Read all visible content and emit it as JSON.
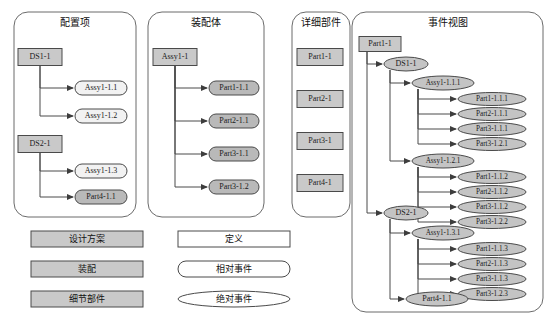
{
  "diagram": {
    "title": "",
    "colors": {
      "rect_fill": "#c9c9c9",
      "stadium_light": "#f2f2f2",
      "stadium_dark": "#b9b9b9",
      "ellipse_fill": "#c4c4c4",
      "panel_stroke": "#6b6b6b",
      "edge_stroke": "#4a4a4a",
      "white": "#ffffff"
    },
    "panels": [
      {
        "id": "p1",
        "title": "配置项",
        "x": 14,
        "y": 12,
        "w": 122,
        "h": 205
      },
      {
        "id": "p2",
        "title": "装配体",
        "x": 148,
        "y": 12,
        "w": 116,
        "h": 205
      },
      {
        "id": "p3",
        "title": "详细部件",
        "x": 292,
        "y": 12,
        "w": 58,
        "h": 205
      },
      {
        "id": "p4",
        "title": "事件视图",
        "x": 352,
        "y": 12,
        "w": 191,
        "h": 300
      }
    ],
    "panel1_nodes": [
      {
        "label": "DS1-1",
        "shape": "rect",
        "tone": "rect",
        "cx": 40,
        "cy": 57,
        "w": 44,
        "h": 17
      },
      {
        "label": "Assy1-1.1",
        "shape": "stadium",
        "tone": "light",
        "cx": 101,
        "cy": 88,
        "w": 52,
        "h": 14
      },
      {
        "label": "Assy1-1.2",
        "shape": "stadium",
        "tone": "light",
        "cx": 101,
        "cy": 116,
        "w": 52,
        "h": 14
      },
      {
        "label": "DS2-1",
        "shape": "rect",
        "tone": "rect",
        "cx": 40,
        "cy": 144,
        "w": 44,
        "h": 17
      },
      {
        "label": "Assy1-1.3",
        "shape": "stadium",
        "tone": "light",
        "cx": 101,
        "cy": 171,
        "w": 52,
        "h": 14
      },
      {
        "label": "Part4-1.1",
        "shape": "stadium",
        "tone": "dark",
        "cx": 101,
        "cy": 197,
        "w": 52,
        "h": 14
      }
    ],
    "panel2_nodes": [
      {
        "label": "Assy1-1",
        "shape": "rect",
        "tone": "rect",
        "cx": 175,
        "cy": 57,
        "w": 44,
        "h": 17
      },
      {
        "label": "Part1-1.1",
        "shape": "stadium",
        "tone": "dark",
        "cx": 234,
        "cy": 88,
        "w": 50,
        "h": 14
      },
      {
        "label": "Part2-1.1",
        "shape": "stadium",
        "tone": "dark",
        "cx": 234,
        "cy": 121,
        "w": 50,
        "h": 14
      },
      {
        "label": "Part3-1.1",
        "shape": "stadium",
        "tone": "dark",
        "cx": 234,
        "cy": 154,
        "w": 50,
        "h": 14
      },
      {
        "label": "Part3-1.2",
        "shape": "stadium",
        "tone": "dark",
        "cx": 234,
        "cy": 187,
        "w": 50,
        "h": 14
      }
    ],
    "panel3_nodes": [
      {
        "label": "Part1-1",
        "shape": "rect",
        "tone": "rect",
        "cx": 320,
        "cy": 57,
        "w": 46,
        "h": 17
      },
      {
        "label": "Part2-1",
        "shape": "rect",
        "tone": "rect",
        "cx": 320,
        "cy": 99,
        "w": 46,
        "h": 17
      },
      {
        "label": "Part3-1",
        "shape": "rect",
        "tone": "rect",
        "cx": 320,
        "cy": 141,
        "w": 46,
        "h": 17
      },
      {
        "label": "Part4-1",
        "shape": "rect",
        "tone": "rect",
        "cx": 320,
        "cy": 183,
        "w": 46,
        "h": 17
      }
    ],
    "panel4_nodes": [
      {
        "label": "Part1-1",
        "shape": "rect",
        "tone": "rect",
        "cx": 380,
        "cy": 44,
        "w": 42,
        "h": 15
      },
      {
        "label": "DS1-1",
        "shape": "ellipse",
        "tone": "ellipse",
        "cx": 406,
        "cy": 64,
        "w": 44,
        "h": 14
      },
      {
        "label": "Assy1-1.1.1",
        "shape": "ellipse",
        "tone": "ellipse",
        "cx": 443,
        "cy": 83,
        "w": 62,
        "h": 14
      },
      {
        "label": "Part1-1.1.1",
        "shape": "ellipse",
        "tone": "ellipse",
        "cx": 492,
        "cy": 99,
        "w": 68,
        "h": 13
      },
      {
        "label": "Part2-1.1.1",
        "shape": "ellipse",
        "tone": "ellipse",
        "cx": 492,
        "cy": 114,
        "w": 68,
        "h": 13
      },
      {
        "label": "Part3-1.1.1",
        "shape": "ellipse",
        "tone": "ellipse",
        "cx": 492,
        "cy": 129,
        "w": 68,
        "h": 13
      },
      {
        "label": "Part3-1.2.1",
        "shape": "ellipse",
        "tone": "ellipse",
        "cx": 492,
        "cy": 144,
        "w": 68,
        "h": 13
      },
      {
        "label": "Assy1-1.2.1",
        "shape": "ellipse",
        "tone": "ellipse",
        "cx": 443,
        "cy": 161,
        "w": 62,
        "h": 14
      },
      {
        "label": "Part1-1.1.2",
        "shape": "ellipse",
        "tone": "ellipse",
        "cx": 492,
        "cy": 177,
        "w": 68,
        "h": 13
      },
      {
        "label": "Part2-1.1.2",
        "shape": "ellipse",
        "tone": "ellipse",
        "cx": 492,
        "cy": 192,
        "w": 68,
        "h": 13
      },
      {
        "label": "Part3-1.1.2",
        "shape": "ellipse",
        "tone": "ellipse",
        "cx": 492,
        "cy": 207,
        "w": 68,
        "h": 13
      },
      {
        "label": "Part3-1.2.2",
        "shape": "ellipse",
        "tone": "ellipse",
        "cx": 492,
        "cy": 222,
        "w": 68,
        "h": 13
      },
      {
        "label": "DS2-1",
        "shape": "ellipse",
        "tone": "ellipse",
        "cx": 406,
        "cy": 213,
        "w": 44,
        "h": 14
      },
      {
        "label": "Assy1-1.3.1",
        "shape": "ellipse",
        "tone": "ellipse",
        "cx": 443,
        "cy": 233,
        "w": 62,
        "h": 14
      },
      {
        "label": "Part1-1.1.3",
        "shape": "ellipse",
        "tone": "ellipse",
        "cx": 492,
        "cy": 249,
        "w": 68,
        "h": 13
      },
      {
        "label": "Part2-1.1.3",
        "shape": "ellipse",
        "tone": "ellipse",
        "cx": 492,
        "cy": 264,
        "w": 68,
        "h": 13
      },
      {
        "label": "Part3-1.1.3",
        "shape": "ellipse",
        "tone": "ellipse",
        "cx": 492,
        "cy": 279,
        "w": 68,
        "h": 13
      },
      {
        "label": "Part3-1.2.3",
        "shape": "ellipse",
        "tone": "ellipse",
        "cx": 492,
        "cy": 294,
        "w": 68,
        "h": 13
      },
      {
        "label": "Part4-1.1",
        "shape": "ellipse",
        "tone": "ellipse",
        "cx": 437,
        "cy": 299,
        "w": 62,
        "h": 14
      }
    ],
    "legend": [
      {
        "label": "设计方案",
        "shape": "rect",
        "tone": "rect",
        "cx": 87,
        "cy": 239,
        "w": 112,
        "h": 16
      },
      {
        "label": "装配",
        "shape": "rect",
        "tone": "rect",
        "cx": 87,
        "cy": 269,
        "w": 112,
        "h": 16
      },
      {
        "label": "细节部件",
        "shape": "rect",
        "tone": "rect",
        "cx": 87,
        "cy": 299,
        "w": 112,
        "h": 16
      },
      {
        "label": "定义",
        "shape": "rect",
        "tone": "white",
        "cx": 234,
        "cy": 239,
        "w": 112,
        "h": 16
      },
      {
        "label": "相对事件",
        "shape": "stadium",
        "tone": "white",
        "cx": 234,
        "cy": 269,
        "w": 112,
        "h": 16
      },
      {
        "label": "绝对事件",
        "shape": "ellipse",
        "tone": "white",
        "cx": 234,
        "cy": 299,
        "w": 112,
        "h": 16
      }
    ],
    "edges": {
      "panel1": [
        {
          "from": "DS1-1",
          "to": "Assy1-1.1",
          "trunk_x": 40,
          "branch_y": 88
        },
        {
          "from": "DS1-1",
          "to": "Assy1-1.2",
          "trunk_x": 40,
          "branch_y": 116
        },
        {
          "from": "DS2-1",
          "to": "Assy1-1.3",
          "trunk_x": 40,
          "branch_y": 171
        },
        {
          "from": "DS2-1",
          "to": "Part4-1.1",
          "trunk_x": 40,
          "branch_y": 197
        }
      ],
      "panel2": [
        {
          "from": "Assy1-1",
          "to": "Part1-1.1",
          "trunk_x": 175,
          "branch_y": 88
        },
        {
          "from": "Assy1-1",
          "to": "Part2-1.1",
          "trunk_x": 175,
          "branch_y": 121
        },
        {
          "from": "Assy1-1",
          "to": "Part3-1.1",
          "trunk_x": 175,
          "branch_y": 154
        },
        {
          "from": "Assy1-1",
          "to": "Part3-1.2",
          "trunk_x": 175,
          "branch_y": 187
        }
      ],
      "panel4": [
        {
          "from": "Part1-1",
          "to": "DS1-1"
        },
        {
          "from": "Part1-1",
          "to": "DS2-1"
        },
        {
          "from": "DS1-1",
          "to": "Assy1-1.1.1"
        },
        {
          "from": "DS1-1",
          "to": "Assy1-1.2.1"
        },
        {
          "from": "Assy1-1.1.1",
          "to": "Part1-1.1.1"
        },
        {
          "from": "Assy1-1.1.1",
          "to": "Part2-1.1.1"
        },
        {
          "from": "Assy1-1.1.1",
          "to": "Part3-1.1.1"
        },
        {
          "from": "Assy1-1.1.1",
          "to": "Part3-1.2.1"
        },
        {
          "from": "Assy1-1.2.1",
          "to": "Part1-1.1.2"
        },
        {
          "from": "Assy1-1.2.1",
          "to": "Part2-1.1.2"
        },
        {
          "from": "Assy1-1.2.1",
          "to": "Part3-1.1.2"
        },
        {
          "from": "Assy1-1.2.1",
          "to": "Part3-1.2.2"
        },
        {
          "from": "DS2-1",
          "to": "Assy1-1.3.1"
        },
        {
          "from": "DS2-1",
          "to": "Part4-1.1"
        },
        {
          "from": "Assy1-1.3.1",
          "to": "Part1-1.1.3"
        },
        {
          "from": "Assy1-1.3.1",
          "to": "Part2-1.1.3"
        },
        {
          "from": "Assy1-1.3.1",
          "to": "Part3-1.1.3"
        },
        {
          "from": "Assy1-1.3.1",
          "to": "Part3-1.2.3"
        }
      ]
    }
  }
}
